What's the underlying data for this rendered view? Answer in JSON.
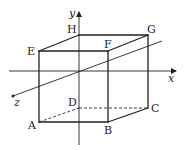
{
  "diagram": {
    "colors": {
      "line": "#222222",
      "background": "#ffffff"
    },
    "axes": [
      {
        "name": "x",
        "label": "x",
        "from": [
          9,
          71
        ],
        "to": [
          176,
          71
        ],
        "label_pos": [
          168,
          82
        ]
      },
      {
        "name": "y",
        "label": "y",
        "from": [
          79,
          145
        ],
        "to": [
          79,
          12
        ],
        "label_pos": [
          69,
          17
        ]
      },
      {
        "name": "z",
        "label": "z",
        "from": [
          162,
          41
        ],
        "to": [
          13,
          96
        ],
        "label_pos": [
          14,
          106
        ]
      }
    ],
    "vertices": [
      {
        "name": "A",
        "label": "A",
        "pos": [
          39,
          122
        ],
        "label_pos": [
          28,
          129
        ]
      },
      {
        "name": "B",
        "label": "B",
        "pos": [
          108,
          122
        ],
        "label_pos": [
          104,
          134
        ]
      },
      {
        "name": "C",
        "label": "C",
        "pos": [
          148,
          108
        ],
        "label_pos": [
          151,
          112
        ]
      },
      {
        "name": "D",
        "label": "D",
        "pos": [
          79,
          108
        ],
        "label_pos": [
          68,
          106
        ]
      },
      {
        "name": "E",
        "label": "E",
        "pos": [
          39,
          51
        ],
        "label_pos": [
          27,
          55
        ]
      },
      {
        "name": "F",
        "label": "F",
        "pos": [
          108,
          51
        ],
        "label_pos": [
          104,
          48
        ]
      },
      {
        "name": "G",
        "label": "G",
        "pos": [
          148,
          35
        ],
        "label_pos": [
          147,
          33
        ]
      },
      {
        "name": "H",
        "label": "H",
        "pos": [
          79,
          35
        ],
        "label_pos": [
          67,
          33
        ]
      }
    ],
    "solid_edges": [
      [
        "A",
        "B"
      ],
      [
        "B",
        "C"
      ],
      [
        "A",
        "E"
      ],
      [
        "B",
        "F"
      ],
      [
        "C",
        "G"
      ],
      [
        "E",
        "F"
      ],
      [
        "F",
        "G"
      ],
      [
        "E",
        "H"
      ],
      [
        "H",
        "G"
      ]
    ],
    "dashed_edges": [
      [
        "A",
        "D"
      ],
      [
        "D",
        "C"
      ]
    ]
  }
}
